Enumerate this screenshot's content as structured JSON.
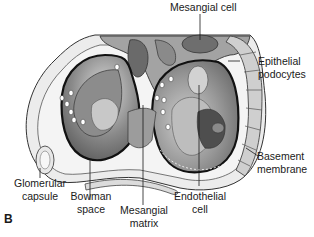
{
  "figure": {
    "panel_letter": "B",
    "labels": {
      "mesangial_cell": "Mesangial cell",
      "epithelial_podocytes_1": "Epithelial",
      "epithelial_podocytes_2": "podocytes",
      "basement_membrane_1": "Basement",
      "basement_membrane_2": "membrane",
      "glomerular_capsule_1": "Glomerular",
      "glomerular_capsule_2": "capsule",
      "bowman_space_1": "Bowman",
      "bowman_space_2": "space",
      "mesangial_matrix_1": "Mesangial",
      "mesangial_matrix_2": "matrix",
      "endothelial_cell_1": "Endothelial",
      "endothelial_cell_2": "cell"
    },
    "colors": {
      "outline": "#1a1a1a",
      "light_gray": "#e6e6e6",
      "mid_gray": "#b5b5b5",
      "dark_gray": "#7a7a7a",
      "darker_gray": "#5a5a5a"
    }
  }
}
